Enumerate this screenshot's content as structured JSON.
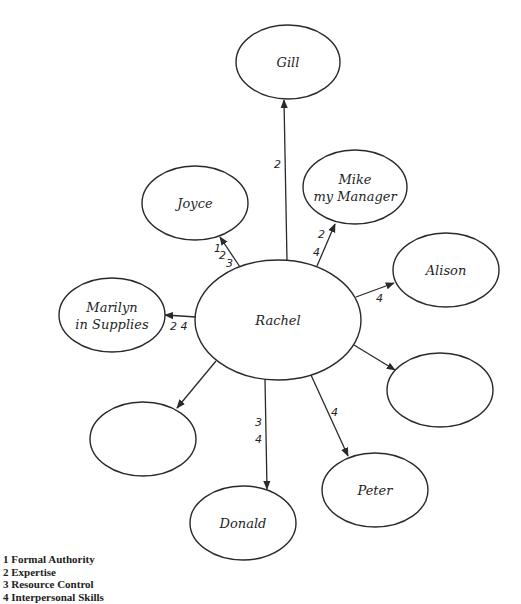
{
  "diagram": {
    "type": "power-network",
    "center_node": "rachel",
    "nodes": [
      {
        "id": "rachel",
        "label_lines": [
          "Rachel"
        ],
        "cx": 278,
        "cy": 320,
        "rx": 83,
        "ry": 60
      },
      {
        "id": "gill",
        "label_lines": [
          "Gill"
        ],
        "cx": 288,
        "cy": 62,
        "rx": 52,
        "ry": 37
      },
      {
        "id": "joyce",
        "label_lines": [
          "Joyce"
        ],
        "cx": 195,
        "cy": 203,
        "rx": 53,
        "ry": 37
      },
      {
        "id": "mike",
        "label_lines": [
          "Mike",
          "my Manager"
        ],
        "cx": 355,
        "cy": 187,
        "rx": 52,
        "ry": 37
      },
      {
        "id": "alison",
        "label_lines": [
          "Alison"
        ],
        "cx": 446,
        "cy": 270,
        "rx": 53,
        "ry": 37
      },
      {
        "id": "marilyn",
        "label_lines": [
          "Marilyn",
          "in Supplies"
        ],
        "cx": 112,
        "cy": 315,
        "rx": 53,
        "ry": 37
      },
      {
        "id": "empty-right",
        "label_lines": [],
        "cx": 440,
        "cy": 390,
        "rx": 53,
        "ry": 37
      },
      {
        "id": "empty-left",
        "label_lines": [],
        "cx": 143,
        "cy": 439,
        "rx": 53,
        "ry": 37
      },
      {
        "id": "donald",
        "label_lines": [
          "Donald"
        ],
        "cx": 243,
        "cy": 523,
        "rx": 53,
        "ry": 37
      },
      {
        "id": "peter",
        "label_lines": [
          "Peter"
        ],
        "cx": 375,
        "cy": 490,
        "rx": 53,
        "ry": 37
      }
    ],
    "edges": [
      {
        "from": "rachel",
        "to": "gill",
        "x1": 287,
        "y1": 261,
        "x2": 284,
        "y2": 100,
        "labels": [
          {
            "text": "2",
            "x": 274,
            "y": 168
          }
        ]
      },
      {
        "from": "rachel",
        "to": "joyce",
        "x1": 240,
        "y1": 267,
        "x2": 220,
        "y2": 237,
        "labels": [
          {
            "text": "1",
            "x": 214,
            "y": 252
          },
          {
            "text": "2",
            "x": 219,
            "y": 259
          },
          {
            "text": "3",
            "x": 226,
            "y": 267
          }
        ]
      },
      {
        "from": "rachel",
        "to": "mike",
        "x1": 317,
        "y1": 266,
        "x2": 335,
        "y2": 224,
        "labels": [
          {
            "text": "2",
            "x": 318,
            "y": 238
          },
          {
            "text": "4",
            "x": 313,
            "y": 256
          }
        ]
      },
      {
        "from": "rachel",
        "to": "alison",
        "x1": 356,
        "y1": 297,
        "x2": 394,
        "y2": 283,
        "labels": [
          {
            "text": "4",
            "x": 376,
            "y": 302
          }
        ]
      },
      {
        "from": "rachel",
        "to": "marilyn",
        "x1": 196,
        "y1": 317,
        "x2": 165,
        "y2": 315,
        "labels": [
          {
            "text": "2 4",
            "x": 170,
            "y": 330
          }
        ]
      },
      {
        "from": "rachel",
        "to": "empty-right",
        "x1": 354,
        "y1": 345,
        "x2": 395,
        "y2": 370,
        "labels": []
      },
      {
        "from": "rachel",
        "to": "empty-left",
        "x1": 216,
        "y1": 361,
        "x2": 177,
        "y2": 408,
        "labels": []
      },
      {
        "from": "rachel",
        "to": "donald",
        "x1": 265,
        "y1": 379,
        "x2": 267,
        "y2": 489,
        "labels": [
          {
            "text": "3",
            "x": 255,
            "y": 426
          },
          {
            "text": "4",
            "x": 255,
            "y": 443
          }
        ]
      },
      {
        "from": "rachel",
        "to": "peter",
        "x1": 311,
        "y1": 375,
        "x2": 348,
        "y2": 456,
        "labels": [
          {
            "text": "4",
            "x": 331,
            "y": 416
          }
        ]
      }
    ],
    "stroke_color": "#2a2a2a",
    "background_color": "#ffffff"
  },
  "legend": {
    "items": [
      {
        "number": "1",
        "label": "Formal Authority"
      },
      {
        "number": "2",
        "label": "Expertise"
      },
      {
        "number": "3",
        "label": "Resource Control"
      },
      {
        "number": "4",
        "label": "Interpersonal Skills"
      }
    ]
  }
}
